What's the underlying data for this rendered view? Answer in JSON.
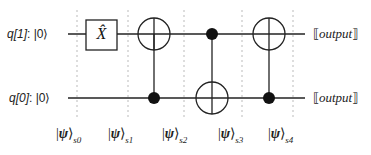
{
  "qubits": [
    {
      "name": "q[1]",
      "init": "|0⟩",
      "output": "output"
    },
    {
      "name": "q[0]",
      "init": "|0⟩",
      "output": "output"
    }
  ],
  "gates": [
    {
      "type": "X",
      "label": "X̂",
      "target": "q[1]",
      "step": 1
    },
    {
      "type": "CNOT",
      "control": "q[0]",
      "target": "q[1]",
      "step": 2
    },
    {
      "type": "CNOT",
      "control": "q[1]",
      "target": "q[0]",
      "step": 3
    },
    {
      "type": "CNOT",
      "control": "q[0]",
      "target": "q[1]",
      "step": 4
    }
  ],
  "states": [
    {
      "psi": "ψ",
      "sub": "s0"
    },
    {
      "psi": "ψ",
      "sub": "s1"
    },
    {
      "psi": "ψ",
      "sub": "s2"
    },
    {
      "psi": "ψ",
      "sub": "s3"
    },
    {
      "psi": "ψ",
      "sub": "s4"
    }
  ],
  "separator": ":",
  "output_open": "⟦",
  "output_close": "⟧",
  "colors": {
    "wire": "#222222",
    "dash": "#bbbbbb",
    "text": "#222222"
  }
}
